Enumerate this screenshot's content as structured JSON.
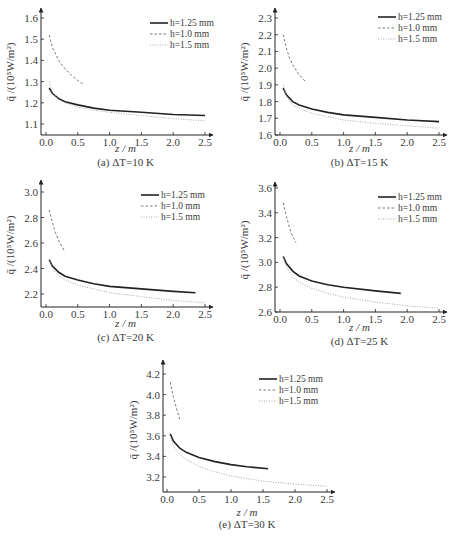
{
  "figure": {
    "ylabel": "q̄ /(10⁵W/m²)",
    "xlabel": "z / m",
    "legend": [
      "h=1.25 mm",
      "h=1.0 mm",
      "h=1.5 mm"
    ],
    "series_styles": {
      "h=1.25 mm": {
        "color": "#222222",
        "dash": "",
        "width": 1.6
      },
      "h=1.0 mm": {
        "color": "#777777",
        "dash": "2.5,2",
        "width": 1.0
      },
      "h=1.5 mm": {
        "color": "#aaaaaa",
        "dash": "1,1.5",
        "width": 1.0
      }
    }
  },
  "chart_data": [
    {
      "type": "line",
      "panel": "a",
      "title": "(a) ΔT=10 K",
      "xlabel": "z / m",
      "ylabel": "q̄ /(10⁵W/m²)",
      "xlim": [
        0.0,
        2.6
      ],
      "ylim": [
        1.08,
        1.65
      ],
      "xticks": [
        "0.0",
        "0.5",
        "1.0",
        "1.5",
        "2.0",
        "2.5"
      ],
      "yticks": [
        "1.1",
        "1.2",
        "1.3",
        "1.4",
        "1.5",
        "1.6"
      ],
      "legend_position": "upper right",
      "grid": false,
      "series": [
        {
          "name": "h=1.25 mm",
          "x": [
            0.05,
            0.1,
            0.2,
            0.3,
            0.5,
            0.75,
            1.0,
            1.5,
            2.0,
            2.5
          ],
          "y": [
            1.27,
            1.245,
            1.22,
            1.205,
            1.19,
            1.175,
            1.165,
            1.155,
            1.145,
            1.14
          ]
        },
        {
          "name": "h=1.0 mm",
          "x": [
            0.05,
            0.1,
            0.2,
            0.3,
            0.4,
            0.5,
            0.6
          ],
          "y": [
            1.52,
            1.46,
            1.4,
            1.36,
            1.33,
            1.305,
            1.285
          ]
        },
        {
          "name": "h=1.5 mm",
          "x": [
            0.05,
            0.1,
            0.2,
            0.3,
            0.5,
            0.75,
            1.0,
            1.5,
            2.0,
            2.5
          ],
          "y": [
            1.3,
            1.25,
            1.215,
            1.2,
            1.18,
            1.165,
            1.155,
            1.14,
            1.125,
            1.115
          ]
        }
      ]
    },
    {
      "type": "line",
      "panel": "b",
      "title": "(b) ΔT=15 K",
      "xlabel": "z / m",
      "ylabel": "q̄ /(10⁵W/m²)",
      "xlim": [
        0.0,
        2.6
      ],
      "ylim": [
        1.6,
        2.35
      ],
      "xticks": [
        "0.0",
        "0.5",
        "1.0",
        "1.5",
        "2.0",
        "2.5"
      ],
      "yticks": [
        "1.6",
        "1.7",
        "1.8",
        "1.9",
        "2.0",
        "2.1",
        "2.2",
        "2.3"
      ],
      "legend_position": "upper right",
      "grid": false,
      "series": [
        {
          "name": "h=1.25 mm",
          "x": [
            0.05,
            0.1,
            0.2,
            0.3,
            0.5,
            0.75,
            1.0,
            1.5,
            2.0,
            2.5
          ],
          "y": [
            1.88,
            1.84,
            1.8,
            1.78,
            1.755,
            1.735,
            1.72,
            1.705,
            1.69,
            1.68
          ]
        },
        {
          "name": "h=1.0 mm",
          "x": [
            0.05,
            0.1,
            0.15,
            0.2,
            0.3,
            0.4
          ],
          "y": [
            2.2,
            2.12,
            2.06,
            2.02,
            1.96,
            1.92
          ]
        },
        {
          "name": "h=1.5 mm",
          "x": [
            0.05,
            0.1,
            0.2,
            0.3,
            0.5,
            0.75,
            1.0,
            1.5,
            2.0,
            2.5
          ],
          "y": [
            1.9,
            1.83,
            1.78,
            1.76,
            1.73,
            1.71,
            1.69,
            1.67,
            1.655,
            1.64
          ]
        }
      ]
    },
    {
      "type": "line",
      "panel": "c",
      "title": "(c) ΔT=20 K",
      "xlabel": "z / m",
      "ylabel": "q̄ /(10⁵W/m²)",
      "xlim": [
        0.0,
        2.6
      ],
      "ylim": [
        2.1,
        3.05
      ],
      "xticks": [
        "0.0",
        "0.5",
        "1.0",
        "1.5",
        "2.0",
        "2.5"
      ],
      "yticks": [
        "2.2",
        "2.4",
        "2.6",
        "2.8",
        "3.0"
      ],
      "legend_position": "upper right",
      "grid": false,
      "series": [
        {
          "name": "h=1.25 mm",
          "x": [
            0.05,
            0.1,
            0.2,
            0.3,
            0.5,
            0.75,
            1.0,
            1.5,
            2.0,
            2.35
          ],
          "y": [
            2.47,
            2.42,
            2.37,
            2.34,
            2.31,
            2.28,
            2.26,
            2.24,
            2.22,
            2.21
          ]
        },
        {
          "name": "h=1.0 mm",
          "x": [
            0.05,
            0.1,
            0.15,
            0.2,
            0.25,
            0.3
          ],
          "y": [
            2.86,
            2.76,
            2.68,
            2.62,
            2.57,
            2.53
          ]
        },
        {
          "name": "h=1.5 mm",
          "x": [
            0.05,
            0.1,
            0.2,
            0.3,
            0.5,
            0.75,
            1.0,
            1.5,
            2.0,
            2.5
          ],
          "y": [
            2.47,
            2.4,
            2.34,
            2.31,
            2.27,
            2.24,
            2.21,
            2.18,
            2.15,
            2.13
          ]
        }
      ]
    },
    {
      "type": "line",
      "panel": "d",
      "title": "(d) ΔT=25 K",
      "xlabel": "z / m",
      "ylabel": "q̄ /(10⁵W/m²)",
      "xlim": [
        0.0,
        2.6
      ],
      "ylim": [
        2.6,
        3.7
      ],
      "xticks": [
        "0.0",
        "0.5",
        "1.0",
        "1.5",
        "2.0",
        "2.5"
      ],
      "yticks": [
        "2.6",
        "2.8",
        "3.0",
        "3.2",
        "3.4",
        "3.6"
      ],
      "legend_position": "upper right",
      "grid": false,
      "series": [
        {
          "name": "h=1.25 mm",
          "x": [
            0.05,
            0.1,
            0.2,
            0.3,
            0.5,
            0.75,
            1.0,
            1.5,
            1.9
          ],
          "y": [
            3.05,
            2.99,
            2.93,
            2.89,
            2.85,
            2.82,
            2.8,
            2.77,
            2.75
          ]
        },
        {
          "name": "h=1.0 mm",
          "x": [
            0.05,
            0.1,
            0.15,
            0.2,
            0.25
          ],
          "y": [
            3.48,
            3.37,
            3.28,
            3.21,
            3.16
          ]
        },
        {
          "name": "h=1.5 mm",
          "x": [
            0.05,
            0.1,
            0.2,
            0.3,
            0.5,
            0.75,
            1.0,
            1.5,
            2.0,
            2.5
          ],
          "y": [
            3.05,
            2.96,
            2.88,
            2.84,
            2.79,
            2.75,
            2.72,
            2.68,
            2.65,
            2.63
          ]
        }
      ]
    },
    {
      "type": "line",
      "panel": "e",
      "title": "(e) ΔT=30 K",
      "xlabel": "z / m",
      "ylabel": "q̄ /(10⁵W/m²)",
      "xlim": [
        0.0,
        2.6
      ],
      "ylim": [
        3.1,
        4.3
      ],
      "xticks": [
        "0.0",
        "0.5",
        "1.0",
        "1.5",
        "2.0",
        "2.5"
      ],
      "yticks": [
        "3.2",
        "3.4",
        "3.6",
        "3.8",
        "4.0",
        "4.2"
      ],
      "legend_position": "upper right",
      "grid": false,
      "series": [
        {
          "name": "h=1.25 mm",
          "x": [
            0.05,
            0.1,
            0.2,
            0.3,
            0.5,
            0.75,
            1.0,
            1.25,
            1.58
          ],
          "y": [
            3.62,
            3.55,
            3.48,
            3.44,
            3.39,
            3.35,
            3.32,
            3.3,
            3.28
          ]
        },
        {
          "name": "h=1.0 mm",
          "x": [
            0.05,
            0.1,
            0.15,
            0.2
          ],
          "y": [
            4.12,
            3.98,
            3.86,
            3.76
          ]
        },
        {
          "name": "h=1.5 mm",
          "x": [
            0.05,
            0.1,
            0.2,
            0.3,
            0.5,
            0.75,
            1.0,
            1.5,
            2.0,
            2.5
          ],
          "y": [
            3.6,
            3.5,
            3.42,
            3.37,
            3.3,
            3.25,
            3.21,
            3.16,
            3.13,
            3.11
          ]
        }
      ]
    }
  ]
}
